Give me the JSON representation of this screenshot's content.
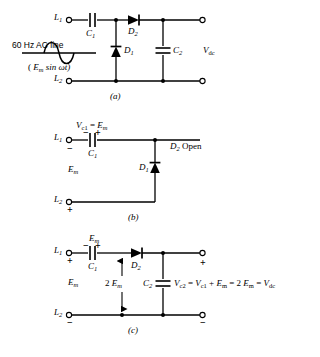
{
  "figure": {
    "background_color": "#ffffff",
    "ink_color": "#000000"
  },
  "panel_a": {
    "caption": "(a)",
    "source_label": "60 Hz AC line",
    "source_expression_prefix": "( ",
    "source_expression_E": "E",
    "source_expression_E_sub": "m",
    "source_expression_rest": " sin ωt)",
    "terminal_top": "L",
    "terminal_top_sub": "1",
    "terminal_bottom": "L",
    "terminal_bottom_sub": "2",
    "cap1": "C",
    "cap1_sub": "1",
    "cap2": "C",
    "cap2_sub": "2",
    "diode1": "D",
    "diode1_sub": "1",
    "diode2": "D",
    "diode2_sub": "2",
    "output": "V",
    "output_sub": "dc"
  },
  "panel_b": {
    "caption": "(b)",
    "cap_voltage_V": "V",
    "cap_voltage_V_sub": "c1",
    "cap_voltage_eq": " = ",
    "cap_voltage_E": "E",
    "cap_voltage_E_sub": "m",
    "terminal_top": "L",
    "terminal_top_sub": "1",
    "terminal_top_sign": "−",
    "terminal_bottom": "L",
    "terminal_bottom_sub": "2",
    "terminal_bottom_sign": "+",
    "source_amplitude_E": "E",
    "source_amplitude_E_sub": "m",
    "cap1": "C",
    "cap1_sub": "1",
    "cap1_left_sign": "−",
    "cap1_right_sign": "+",
    "diode1": "D",
    "diode1_sub": "1",
    "diode2": "D",
    "diode2_sub": "2",
    "diode2_state": " Open"
  },
  "panel_c": {
    "caption": "(c)",
    "cap1_voltage_E": "E",
    "cap1_voltage_E_sub": "m",
    "terminal_top": "L",
    "terminal_top_sub": "1",
    "terminal_top_sign": "+",
    "terminal_bottom": "L",
    "terminal_bottom_sub": "2",
    "terminal_bottom_sign": "−",
    "source_amplitude_E": "E",
    "source_amplitude_E_sub": "m",
    "cap1": "C",
    "cap1_sub": "1",
    "cap1_left_sign": "−",
    "cap1_right_sign": "+",
    "cap2": "C",
    "cap2_sub": "2",
    "diode2": "D",
    "diode2_sub": "2",
    "arrow_label_num": "2 ",
    "arrow_label_E": "E",
    "arrow_label_E_sub": "m",
    "equation": [
      {
        "t": "V",
        "s": "c2"
      },
      {
        "t": " = ",
        "s": ""
      },
      {
        "t": "V",
        "s": "c1"
      },
      {
        "t": " + ",
        "s": ""
      },
      {
        "t": "E",
        "s": "m"
      },
      {
        "t": " = 2 ",
        "s": ""
      },
      {
        "t": "E",
        "s": "m"
      },
      {
        "t": " = ",
        "s": ""
      },
      {
        "t": "V",
        "s": "dc"
      }
    ],
    "output_plus": "+",
    "output_minus": "−"
  }
}
